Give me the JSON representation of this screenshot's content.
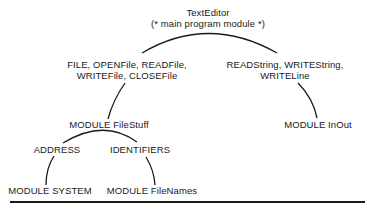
{
  "diagram": {
    "root": {
      "title": "TextEditor",
      "subtitle": "(* main program module *)"
    },
    "left_import": {
      "line1": "FILE, OPENFile, READFile,",
      "line2": "WRITEFile, CLOSEFile"
    },
    "right_import": {
      "line1": "READString, WRITEString,",
      "line2": "WRITELine"
    },
    "modules": {
      "filestuff": "MODULE FileStuff",
      "inout": "MODULE InOut",
      "system": "MODULE SYSTEM",
      "filenames": "MODULE FileNames"
    },
    "filestuff_imports": {
      "left": "ADDRESS",
      "right": "IDENTIFIERS"
    },
    "colors": {
      "line": "#1a1a1a",
      "text": "#1a1a1a",
      "background": "#ffffff"
    }
  }
}
